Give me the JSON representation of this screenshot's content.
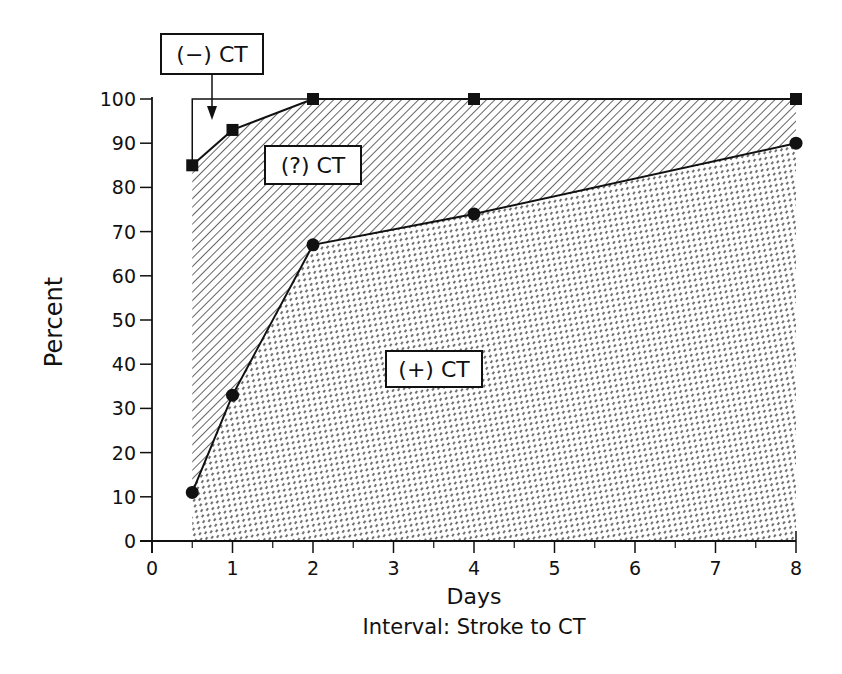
{
  "chart_data": {
    "type": "area",
    "title": "",
    "xlabel": "Days",
    "xlabel_sub": "Interval: Stroke to CT",
    "ylabel": "Percent",
    "xlim": [
      0,
      8
    ],
    "ylim": [
      0,
      100
    ],
    "x_ticks": [
      "0",
      "1",
      "2",
      "3",
      "4",
      "5",
      "6",
      "7",
      "8"
    ],
    "y_ticks": [
      "0",
      "10",
      "20",
      "30",
      "40",
      "50",
      "60",
      "70",
      "80",
      "90",
      "100"
    ],
    "grid": false,
    "x": [
      0.5,
      1,
      2,
      4,
      8
    ],
    "series": [
      {
        "name": "(−) CT upper bound",
        "marker": "square",
        "values": [
          85,
          93,
          100,
          100,
          100
        ]
      },
      {
        "name": "(+) CT",
        "marker": "circle",
        "values": [
          11,
          33,
          67,
          74,
          90
        ]
      }
    ],
    "regions": [
      {
        "label": "(−) CT",
        "description": "area above square series up to 100%",
        "fill": "none"
      },
      {
        "label": "(?) CT",
        "description": "between circle and square series",
        "fill": "diagonal hatch"
      },
      {
        "label": "(+) CT",
        "description": "below circle series",
        "fill": "dashed hatch"
      }
    ],
    "annotations": [
      "(−) CT",
      "(?) CT",
      "(+) CT"
    ]
  }
}
